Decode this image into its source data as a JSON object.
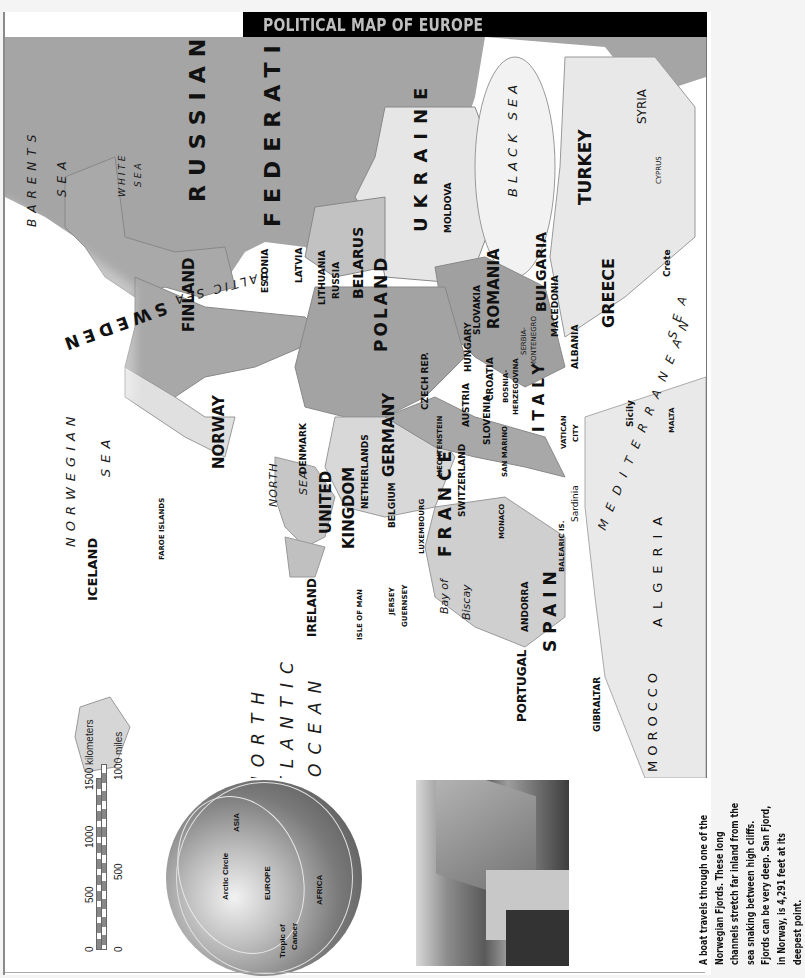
{
  "title": "POLITICAL MAP OF EUROPE",
  "seas": {
    "barents_1": "BARENTS",
    "barents_2": "SEA",
    "white_1": "WHITE",
    "white_2": "SEA",
    "baltic": "BALTIC SEA",
    "norwegian_1": "NORWEGIAN",
    "norwegian_2": "SEA",
    "north_1": "NORTH",
    "north_2": "SEA",
    "atlantic_1": "NORTH",
    "atlantic_2": "ATLANTIC",
    "atlantic_3": "OCEAN",
    "biscay_1": "Bay of",
    "biscay_2": "Biscay",
    "black": "BLACK SEA",
    "mediterranean_1": "MEDITERRANEAN",
    "mediterranean_2": "SEA"
  },
  "countries": {
    "russia_1": "RUSSIAN",
    "russia_2": "FEDERATION",
    "ukraine": "UKRAINE",
    "belarus": "BELARUS",
    "finland": "FINLAND",
    "sweden": "SWEDEN",
    "norway": "NORWAY",
    "estonia": "ESTONIA",
    "latvia": "LATVIA",
    "lithuania": "LITHUANIA",
    "russia_kaliningrad": "RUSSIA",
    "poland": "POLAND",
    "moldova": "MOLDOVA",
    "romania": "ROMANIA",
    "bulgaria": "BULGARIA",
    "turkey": "TURKEY",
    "syria": "SYRIA",
    "cyprus": "CYPRUS",
    "crete": "Crete",
    "greece": "GREECE",
    "macedonia": "MACEDONIA",
    "albania": "ALBANIA",
    "serbia_1": "SERBIA-",
    "serbia_2": "MONTENEGRO",
    "bosnia_1": "BOSNIA-",
    "bosnia_2": "HERZEGOVINA",
    "croatia": "CROATIA",
    "hungary": "HUNGARY",
    "slovakia": "SLOVAKIA",
    "czech": "CZECH REP.",
    "austria": "AUSTRIA",
    "slovenia": "SLOVENIA",
    "liechtenstein": "LIECHTENSTEIN",
    "switzerland": "SWITZERLAND",
    "san_marino": "SAN MARINO",
    "italy": "ITALY",
    "vatican_1": "VATICAN",
    "vatican_2": "CITY",
    "sicily": "Sicily",
    "malta": "MALTA",
    "sardinia": "Sardinia",
    "monaco": "MONACO",
    "germany": "GERMANY",
    "denmark": "DENMARK",
    "netherlands": "NETHERLANDS",
    "belgium": "BELGIUM",
    "luxembourg": "LUXEMBOURG",
    "france": "FRANCE",
    "uk_1": "UNITED",
    "uk_2": "KINGDOM",
    "ireland": "IRELAND",
    "isle_of_man": "ISLE OF MAN",
    "jersey": "JERSEY",
    "guernsey": "GUERNSEY",
    "faroe": "FAROE ISLANDS",
    "iceland": "ICELAND",
    "andorra": "ANDORRA",
    "balearic": "BALEARIC IS.",
    "spain": "SPAIN",
    "portugal": "PORTUGAL",
    "gibraltar": "GIBRALTAR",
    "morocco": "MOROCCO",
    "algeria": "ALGERIA"
  },
  "globe": {
    "asia": "ASIA",
    "europe": "EUROPE",
    "africa": "AFRICA",
    "arctic": "Arctic Circle",
    "tropic_1": "Tropic of",
    "tropic_2": "Cancer"
  },
  "scale": {
    "km_label": "1500 kilometers",
    "km_ticks": [
      "0",
      "500",
      "1000"
    ],
    "mi_label": "1000 miles",
    "mi_ticks": [
      "0",
      "500"
    ]
  },
  "caption": {
    "lines": [
      "A boat travels through one of the",
      "Norwegian Fjords. These long",
      "channels stretch far inland from the",
      "sea snaking between high cliffs.",
      "Fjords can be very deep. San Fjord,",
      "in Norway, is 4,291 feet at its",
      "deepest point."
    ]
  },
  "colors": {
    "title_bg": "#000000",
    "title_text": "#bfbfbf",
    "land_dark": "#9a9a9a",
    "land_mid": "#b5b5b5",
    "land_light": "#e6e6e6",
    "water": "#ffffff"
  }
}
